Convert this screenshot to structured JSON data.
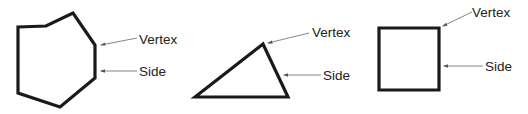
{
  "diagram": {
    "colors": {
      "shape_stroke": "#1a1a1a",
      "leader_line": "#777777",
      "label_text": "#222222",
      "background": "#ffffff"
    },
    "figures": [
      {
        "name": "heptagon",
        "points": "18,27 46,26 73,13 95,45 95,78 60,107 18,93",
        "labels": {
          "vertex": "Vertex",
          "side": "Side"
        },
        "vertex_leader": {
          "x1": 137,
          "y1": 38,
          "x2": 101,
          "y2": 45
        },
        "side_leader": {
          "x1": 137,
          "y1": 71,
          "x2": 101,
          "y2": 71
        },
        "vertex_label_pos": {
          "x": 139,
          "y": 44
        },
        "side_label_pos": {
          "x": 139,
          "y": 76
        }
      },
      {
        "name": "triangle",
        "points": "195,97 263,44 288,97",
        "labels": {
          "vertex": "Vertex",
          "side": "Side"
        },
        "vertex_leader": {
          "x1": 309,
          "y1": 33,
          "x2": 268,
          "y2": 43
        },
        "side_leader": {
          "x1": 321,
          "y1": 75,
          "x2": 284,
          "y2": 75
        },
        "vertex_label_pos": {
          "x": 312,
          "y": 37
        },
        "side_label_pos": {
          "x": 323,
          "y": 80
        }
      },
      {
        "name": "square",
        "points": "379,28 439,28 439,90 379,90",
        "labels": {
          "vertex": "Vertex",
          "side": "Side"
        },
        "vertex_leader": {
          "x1": 472,
          "y1": 12,
          "x2": 443,
          "y2": 26
        },
        "side_leader": {
          "x1": 483,
          "y1": 66,
          "x2": 444,
          "y2": 66
        },
        "vertex_label_pos": {
          "x": 472,
          "y": 17
        },
        "side_label_pos": {
          "x": 485,
          "y": 71
        }
      }
    ]
  }
}
